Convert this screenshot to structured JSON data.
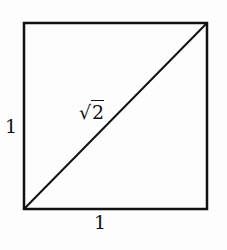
{
  "diagram": {
    "type": "unit-square-with-diagonal",
    "shapes": {
      "square": {
        "x": 24,
        "y": 23,
        "width": 183,
        "height": 186,
        "stroke": "#111111",
        "stroke_width": 2.5
      },
      "diagonal": {
        "from": "bottom-left",
        "to": "top-right"
      }
    },
    "labels": {
      "left_side": "1",
      "bottom_side": "1",
      "diagonal_radical": "√",
      "diagonal_radicand": "2"
    }
  }
}
